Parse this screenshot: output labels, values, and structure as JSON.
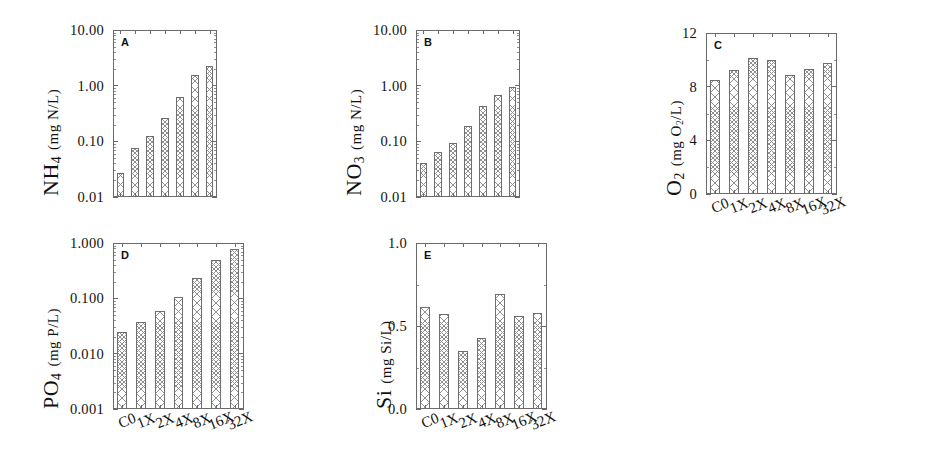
{
  "figure": {
    "background": "#ffffff",
    "bar_fill": "#ffffff",
    "bar_edge": "#6e6e6e",
    "hatch_color": "#909090",
    "axis_color": "#6a6a6a",
    "categories": [
      "C0",
      "1X",
      "2X",
      "4X",
      "8X",
      "16X",
      "32X"
    ]
  },
  "chart_data": [
    {
      "type": "bar",
      "panel": "A",
      "title": "",
      "xlabel": "",
      "ylabel": "NH4 (mg N/L)",
      "ylabel_parts": {
        "main": "NH",
        "sub": "4",
        "unit": "(mg N/L)"
      },
      "yscale": "log",
      "ylim": [
        0.01,
        10.0
      ],
      "yticks": [
        0.01,
        0.1,
        1.0,
        10.0
      ],
      "ytick_labels": [
        "0.01",
        "0.10",
        "1.00",
        "10.00"
      ],
      "grid": false,
      "categories": [
        "C0",
        "1X",
        "2X",
        "4X",
        "8X",
        "16X",
        "32X"
      ],
      "values": [
        0.027,
        0.077,
        0.126,
        0.26,
        0.63,
        1.55,
        2.3
      ],
      "show_xlabels": false
    },
    {
      "type": "bar",
      "panel": "B",
      "title": "",
      "xlabel": "",
      "ylabel": "NO3 (mg N/L)",
      "ylabel_parts": {
        "main": "NO",
        "sub": "3",
        "unit": "(mg N/L)"
      },
      "yscale": "log",
      "ylim": [
        0.01,
        10.0
      ],
      "yticks": [
        0.01,
        0.1,
        1.0,
        10.0
      ],
      "ytick_labels": [
        "0.01",
        "0.10",
        "1.00",
        "10.00"
      ],
      "grid": false,
      "categories": [
        "C0",
        "1X",
        "2X",
        "4X",
        "8X",
        "16X",
        "32X"
      ],
      "values": [
        0.041,
        0.064,
        0.095,
        0.19,
        0.43,
        0.67,
        0.94
      ],
      "show_xlabels": false
    },
    {
      "type": "bar",
      "panel": "C",
      "title": "",
      "xlabel": "",
      "ylabel": "O2 (mg O2/L)",
      "ylabel_parts": {
        "main": "O",
        "sub": "2",
        "unit": "(mg O2/L)"
      },
      "yscale": "linear",
      "ylim": [
        0,
        12
      ],
      "yticks": [
        0,
        4,
        8,
        12
      ],
      "ytick_labels": [
        "0",
        "4",
        "8",
        "12"
      ],
      "grid": false,
      "categories": [
        "C0",
        "1X",
        "2X",
        "4X",
        "8X",
        "16X",
        "32X"
      ],
      "values": [
        8.5,
        9.25,
        10.1,
        10.0,
        8.9,
        9.3,
        9.8
      ],
      "show_xlabels": true
    },
    {
      "type": "bar",
      "panel": "D",
      "title": "",
      "xlabel": "",
      "ylabel": "PO4 (mg P/L)",
      "ylabel_parts": {
        "main": "PO",
        "sub": "4",
        "unit": "(mg P/L)"
      },
      "yscale": "log",
      "ylim": [
        0.001,
        1.0
      ],
      "yticks": [
        0.001,
        0.01,
        0.1,
        1.0
      ],
      "ytick_labels": [
        "0.001",
        "0.010",
        "0.100",
        "1.000"
      ],
      "grid": false,
      "categories": [
        "C0",
        "1X",
        "2X",
        "4X",
        "8X",
        "16X",
        "32X"
      ],
      "values": [
        0.025,
        0.038,
        0.06,
        0.105,
        0.23,
        0.5,
        0.78
      ],
      "show_xlabels": true
    },
    {
      "type": "bar",
      "panel": "E",
      "title": "",
      "xlabel": "",
      "ylabel": "Si (mg Si/L)",
      "ylabel_parts": {
        "main": "Si",
        "sub": "",
        "unit": "(mg Si/L)"
      },
      "yscale": "linear",
      "ylim": [
        0.0,
        1.0
      ],
      "yticks": [
        0.0,
        0.5,
        1.0
      ],
      "ytick_labels": [
        "0.0",
        "0.5",
        "1.0"
      ],
      "grid": false,
      "categories": [
        "C0",
        "1X",
        "2X",
        "4X",
        "8X",
        "16X",
        "32X"
      ],
      "values": [
        0.615,
        0.57,
        0.35,
        0.43,
        0.69,
        0.56,
        0.58
      ],
      "show_xlabels": true
    }
  ]
}
